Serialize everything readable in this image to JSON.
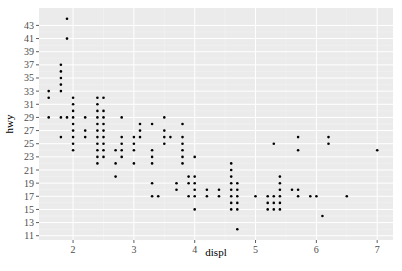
{
  "chart_data": {
    "type": "scatter",
    "title": "",
    "xlabel": "displ",
    "ylabel": "hwy",
    "xlim": [
      1.44,
      7.26
    ],
    "ylim": [
      10.35,
      45.65
    ],
    "x_ticks": [
      2,
      3,
      4,
      5,
      6,
      7
    ],
    "y_ticks": [
      11,
      13,
      15,
      17,
      19,
      21,
      23,
      25,
      27,
      29,
      31,
      33,
      35,
      37,
      39,
      41,
      43
    ],
    "grid": true,
    "legend": null,
    "background": "#ebebeb",
    "point_color": "#000000",
    "points": [
      [
        1.6,
        33
      ],
      [
        1.6,
        32
      ],
      [
        1.6,
        29
      ],
      [
        1.8,
        29
      ],
      [
        1.8,
        26
      ],
      [
        1.8,
        37
      ],
      [
        1.8,
        35
      ],
      [
        1.8,
        36
      ],
      [
        1.8,
        34
      ],
      [
        1.8,
        33
      ],
      [
        1.9,
        44
      ],
      [
        1.9,
        41
      ],
      [
        1.9,
        29
      ],
      [
        2.0,
        31
      ],
      [
        2.0,
        30
      ],
      [
        2.0,
        28
      ],
      [
        2.0,
        29
      ],
      [
        2.0,
        26
      ],
      [
        2.0,
        27
      ],
      [
        2.0,
        25
      ],
      [
        2.0,
        24
      ],
      [
        2.0,
        32
      ],
      [
        2.2,
        26
      ],
      [
        2.2,
        27
      ],
      [
        2.2,
        29
      ],
      [
        2.4,
        31
      ],
      [
        2.4,
        30
      ],
      [
        2.4,
        29
      ],
      [
        2.4,
        28
      ],
      [
        2.4,
        27
      ],
      [
        2.4,
        26
      ],
      [
        2.4,
        24
      ],
      [
        2.4,
        32
      ],
      [
        2.4,
        25
      ],
      [
        2.4,
        23
      ],
      [
        2.4,
        22
      ],
      [
        2.5,
        27
      ],
      [
        2.5,
        26
      ],
      [
        2.5,
        25
      ],
      [
        2.5,
        23
      ],
      [
        2.5,
        29
      ],
      [
        2.5,
        30
      ],
      [
        2.5,
        32
      ],
      [
        2.5,
        24
      ],
      [
        2.5,
        28
      ],
      [
        2.7,
        20
      ],
      [
        2.7,
        22
      ],
      [
        2.7,
        24
      ],
      [
        2.8,
        26
      ],
      [
        2.8,
        25
      ],
      [
        2.8,
        23
      ],
      [
        2.8,
        24
      ],
      [
        2.8,
        29
      ],
      [
        3.0,
        26
      ],
      [
        3.0,
        25
      ],
      [
        3.0,
        22
      ],
      [
        3.0,
        24
      ],
      [
        3.1,
        26
      ],
      [
        3.1,
        27
      ],
      [
        3.1,
        28
      ],
      [
        3.3,
        24
      ],
      [
        3.3,
        28
      ],
      [
        3.3,
        17
      ],
      [
        3.3,
        19
      ],
      [
        3.3,
        22
      ],
      [
        3.3,
        23
      ],
      [
        3.4,
        17
      ],
      [
        3.5,
        26
      ],
      [
        3.5,
        25
      ],
      [
        3.5,
        27
      ],
      [
        3.5,
        29
      ],
      [
        3.6,
        26
      ],
      [
        3.7,
        19
      ],
      [
        3.7,
        18
      ],
      [
        3.8,
        28
      ],
      [
        3.8,
        26
      ],
      [
        3.8,
        25
      ],
      [
        3.8,
        24
      ],
      [
        3.8,
        22
      ],
      [
        3.8,
        23
      ],
      [
        3.9,
        20
      ],
      [
        3.9,
        17
      ],
      [
        3.9,
        19
      ],
      [
        4.0,
        23
      ],
      [
        4.0,
        19
      ],
      [
        4.0,
        20
      ],
      [
        4.0,
        17
      ],
      [
        4.0,
        15
      ],
      [
        4.0,
        18
      ],
      [
        4.2,
        18
      ],
      [
        4.2,
        17
      ],
      [
        4.4,
        18
      ],
      [
        4.4,
        17
      ],
      [
        4.6,
        21
      ],
      [
        4.6,
        22
      ],
      [
        4.6,
        17
      ],
      [
        4.6,
        16
      ],
      [
        4.6,
        15
      ],
      [
        4.6,
        18
      ],
      [
        4.6,
        19
      ],
      [
        4.6,
        20
      ],
      [
        4.7,
        18
      ],
      [
        4.7,
        15
      ],
      [
        4.7,
        19
      ],
      [
        4.7,
        16
      ],
      [
        4.7,
        12
      ],
      [
        4.7,
        17
      ],
      [
        5.0,
        17
      ],
      [
        5.2,
        17
      ],
      [
        5.2,
        15
      ],
      [
        5.2,
        16
      ],
      [
        5.3,
        16
      ],
      [
        5.3,
        15
      ],
      [
        5.3,
        25
      ],
      [
        5.3,
        17
      ],
      [
        5.4,
        18
      ],
      [
        5.4,
        17
      ],
      [
        5.4,
        16
      ],
      [
        5.4,
        20
      ],
      [
        5.4,
        19
      ],
      [
        5.4,
        15
      ],
      [
        5.6,
        18
      ],
      [
        5.7,
        17
      ],
      [
        5.7,
        24
      ],
      [
        5.7,
        26
      ],
      [
        5.7,
        18
      ],
      [
        5.9,
        17
      ],
      [
        6.0,
        17
      ],
      [
        6.1,
        14
      ],
      [
        6.2,
        26
      ],
      [
        6.2,
        25
      ],
      [
        6.5,
        17
      ],
      [
        7.0,
        24
      ]
    ]
  }
}
